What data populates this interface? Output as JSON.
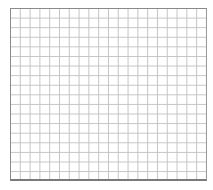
{
  "grid": {
    "columns": 20,
    "rows": 18,
    "line_color": "#c4c4c4",
    "border_color": "#8a8a8a",
    "background": "#ffffff"
  }
}
